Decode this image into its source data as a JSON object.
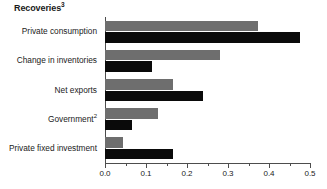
{
  "chart_data": {
    "type": "bar",
    "orientation": "horizontal",
    "title": "Recoveries",
    "title_superscript": "3",
    "xlabel": "",
    "ylabel": "",
    "xlim": [
      0.0,
      0.5
    ],
    "grid": false,
    "legend_position": "none",
    "categories": [
      "Private consumption",
      "Change in inventories",
      "Net exports",
      "Government",
      "Private fixed investment"
    ],
    "category_superscripts": [
      "",
      "",
      "",
      "2",
      ""
    ],
    "series": [
      {
        "name": "gray",
        "color": "#6e6e6e",
        "values": [
          0.373,
          0.28,
          0.165,
          0.13,
          0.043
        ]
      },
      {
        "name": "black",
        "color": "#0a0a0a",
        "values": [
          0.476,
          0.115,
          0.24,
          0.066,
          0.167
        ]
      }
    ],
    "xticks": [
      0.0,
      0.1,
      0.2,
      0.3,
      0.4,
      0.5
    ],
    "xtick_labels": [
      "0.0",
      "0.1",
      "0.2",
      "0.3",
      "0.4",
      "0.5"
    ],
    "xticks_minor": [
      0.05,
      0.15,
      0.25,
      0.35,
      0.45
    ],
    "axis_color": "#4d4d4d"
  }
}
